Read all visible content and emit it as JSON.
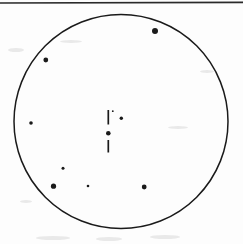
{
  "figure": {
    "background_color": "#fdfdfd",
    "ink_color": "#1a1a1a",
    "width": 243,
    "height": 244
  },
  "top_rule": {
    "label": "page-top-rule",
    "x1": 0,
    "y1": 3,
    "x2": 243,
    "y2": 2.4,
    "color": "#2a2a2a",
    "stroke_width": 1.6
  },
  "field_circle": {
    "label": "field-of-view boundary circle",
    "cx": 121,
    "cy": 121.5,
    "r": 107,
    "color": "#1a1a1a",
    "stroke_width": 1.5
  },
  "center_marker": {
    "label": "center reticle marker",
    "center_dot": {
      "cx": 108.3,
      "cy": 133.2,
      "r": 2.3
    },
    "upper_tick": {
      "x": 108.3,
      "y1": 110.0,
      "y2": 124.5,
      "stroke_width": 1.7
    },
    "lower_tick": {
      "x": 108.3,
      "y1": 140.0,
      "y2": 152.5,
      "stroke_width": 1.7
    }
  },
  "chart_data": {
    "type": "scatter",
    "xlabel": "",
    "ylabel": "",
    "xlim": [
      14,
      228
    ],
    "ylim": [
      14.5,
      228.5
    ],
    "grid": false,
    "legend": "none",
    "field_circle": {
      "cx": 121,
      "cy": 121.5,
      "r": 107
    },
    "points": [
      {
        "id": "p1",
        "x": 155.0,
        "y": 31.0,
        "r": 3.0,
        "size": "large",
        "note": "upper-right bright point near rim"
      },
      {
        "id": "p2",
        "x": 45.8,
        "y": 60.0,
        "r": 2.4,
        "size": "medium",
        "note": "upper-left point"
      },
      {
        "id": "p3",
        "x": 31.0,
        "y": 123.0,
        "r": 1.8,
        "size": "small",
        "note": "left-edge faint point"
      },
      {
        "id": "p4",
        "x": 121.3,
        "y": 118.3,
        "r": 1.7,
        "size": "small",
        "note": "small point right of reticle"
      },
      {
        "id": "p5",
        "x": 112.8,
        "y": 111.2,
        "r": 0.9,
        "size": "tiny",
        "note": "very faint speck above reticle"
      },
      {
        "id": "p6",
        "x": 63.0,
        "y": 168.2,
        "r": 1.5,
        "size": "small",
        "note": "lower-left faint point"
      },
      {
        "id": "p7",
        "x": 53.5,
        "y": 186.2,
        "r": 2.6,
        "size": "medium",
        "note": "lower-left point"
      },
      {
        "id": "p8",
        "x": 88.0,
        "y": 186.0,
        "r": 1.3,
        "size": "tiny",
        "note": "lower-middle faint point"
      },
      {
        "id": "p9",
        "x": 144.2,
        "y": 187.0,
        "r": 2.4,
        "size": "medium",
        "note": "lower-right point"
      }
    ],
    "center_marker": {
      "x": 108.3,
      "y": 133.2,
      "shape": "dot-with-vertical-ticks",
      "tick_above": [
        110.0,
        124.5
      ],
      "tick_below": [
        140.0,
        152.5
      ]
    }
  },
  "scan_artifacts": [
    {
      "x": 8,
      "y": 48,
      "w": 16,
      "h": 4
    },
    {
      "x": 60,
      "y": 40,
      "w": 22,
      "h": 3
    },
    {
      "x": 168,
      "y": 126,
      "w": 20,
      "h": 3
    },
    {
      "x": 36,
      "y": 236,
      "w": 34,
      "h": 4
    },
    {
      "x": 96,
      "y": 237,
      "w": 26,
      "h": 4
    },
    {
      "x": 150,
      "y": 235,
      "w": 30,
      "h": 4
    },
    {
      "x": 200,
      "y": 70,
      "w": 14,
      "h": 3
    },
    {
      "x": 20,
      "y": 200,
      "w": 12,
      "h": 3
    }
  ]
}
